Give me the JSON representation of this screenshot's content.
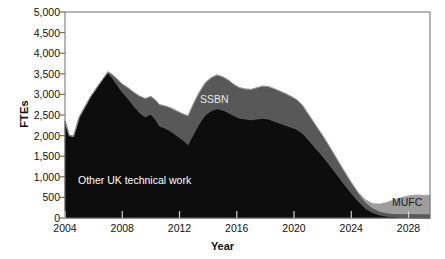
{
  "chart_data": {
    "type": "area",
    "stacked": true,
    "title": "",
    "xlabel": "Year",
    "ylabel": "FTEs",
    "xlim": [
      2004,
      2029.5
    ],
    "ylim": [
      0,
      5000
    ],
    "grid": false,
    "legend_position": "inline-labels",
    "xticks": [
      "2004",
      "2008",
      "2012",
      "2016",
      "2020",
      "2024",
      "2028"
    ],
    "xtick_values": [
      2004,
      2008,
      2012,
      2016,
      2020,
      2024,
      2028
    ],
    "yticks": [
      "0",
      "500",
      "1,000",
      "1,500",
      "2,000",
      "2,500",
      "3,000",
      "3,500",
      "4,000",
      "4,500",
      "5,000"
    ],
    "ytick_values": [
      0,
      500,
      1000,
      1500,
      2000,
      2500,
      3000,
      3500,
      4000,
      4500,
      5000
    ],
    "colors": {
      "other_uk_technical_work": "#0d0d0d",
      "ssbn": "#585858",
      "mufc": "#9e9e9e",
      "axis": "#6f6f6f",
      "text": "#111111"
    },
    "x": [
      2004.0,
      2004.3,
      2004.6,
      2005.0,
      2005.4,
      2005.8,
      2006.2,
      2006.6,
      2007.0,
      2007.3,
      2007.6,
      2008.0,
      2008.4,
      2008.8,
      2009.2,
      2009.6,
      2010.0,
      2010.3,
      2010.6,
      2011.0,
      2011.4,
      2011.8,
      2012.2,
      2012.6,
      2013.0,
      2013.4,
      2013.8,
      2014.2,
      2014.6,
      2015.0,
      2015.4,
      2015.8,
      2016.2,
      2016.6,
      2017.0,
      2017.4,
      2017.8,
      2018.2,
      2018.6,
      2019.0,
      2019.4,
      2019.8,
      2020.2,
      2020.6,
      2021.0,
      2021.5,
      2022.0,
      2022.5,
      2023.0,
      2023.5,
      2024.0,
      2024.5,
      2025.0,
      2025.5,
      2026.0,
      2026.5,
      2027.0,
      2027.5,
      2028.0,
      2028.5,
      2029.0,
      2029.5
    ],
    "series": [
      {
        "name": "Other UK technical work",
        "label": "Other UK technical work",
        "color": "#0d0d0d",
        "values": [
          2350,
          2000,
          1980,
          2450,
          2700,
          2950,
          3150,
          3350,
          3520,
          3400,
          3250,
          3050,
          2900,
          2720,
          2560,
          2450,
          2520,
          2400,
          2230,
          2180,
          2100,
          2000,
          1900,
          1780,
          2050,
          2300,
          2500,
          2600,
          2650,
          2620,
          2560,
          2480,
          2420,
          2400,
          2380,
          2400,
          2420,
          2400,
          2350,
          2300,
          2250,
          2200,
          2150,
          2050,
          1900,
          1700,
          1500,
          1280,
          1050,
          820,
          600,
          400,
          230,
          130,
          70,
          40,
          25,
          15,
          10,
          5,
          0,
          0
        ]
      },
      {
        "name": "SSBN",
        "label": "SSBN",
        "color": "#585858",
        "values": [
          0,
          0,
          0,
          0,
          0,
          0,
          0,
          0,
          30,
          80,
          140,
          200,
          260,
          330,
          400,
          450,
          430,
          470,
          520,
          540,
          570,
          600,
          630,
          700,
          740,
          760,
          780,
          800,
          820,
          810,
          790,
          760,
          740,
          730,
          740,
          760,
          780,
          790,
          790,
          780,
          770,
          750,
          720,
          680,
          620,
          560,
          500,
          440,
          380,
          320,
          260,
          200,
          150,
          110,
          90,
          80,
          80,
          85,
          90,
          95,
          95,
          95
        ]
      },
      {
        "name": "MUFC",
        "label": "MUFC",
        "color": "#9e9e9e",
        "values": [
          0,
          0,
          0,
          0,
          0,
          0,
          0,
          0,
          0,
          0,
          0,
          0,
          0,
          0,
          0,
          0,
          0,
          0,
          0,
          0,
          0,
          0,
          0,
          0,
          0,
          0,
          0,
          0,
          0,
          0,
          0,
          0,
          0,
          0,
          0,
          0,
          0,
          0,
          0,
          0,
          0,
          0,
          0,
          0,
          0,
          0,
          0,
          0,
          0,
          0,
          0,
          20,
          60,
          110,
          180,
          260,
          340,
          400,
          440,
          460,
          460,
          455
        ]
      }
    ],
    "annotations": [
      {
        "text": "Other UK technical work",
        "series": "Other UK technical work"
      },
      {
        "text": "SSBN",
        "series": "SSBN"
      },
      {
        "text": "MUFC",
        "series": "MUFC"
      }
    ]
  }
}
